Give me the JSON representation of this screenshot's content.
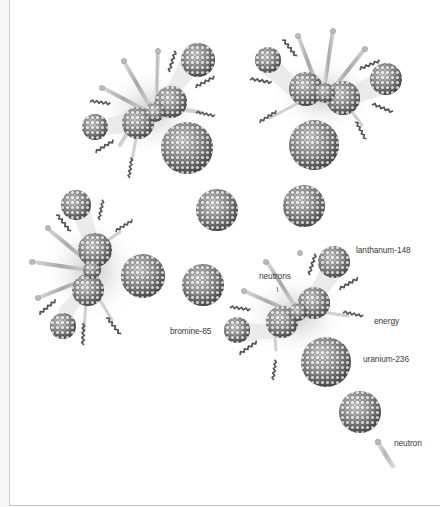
{
  "diagram": {
    "labels": {
      "lanthanum": "lanthanum-148",
      "neutrons": "neutrons",
      "energy": "energy",
      "uranium": "uranium-236",
      "bromine": "bromine-85",
      "neutron": "neutron"
    },
    "colors": {
      "background": "#ffffff",
      "nucleus_dark": "#3c3c3c",
      "nucleus_light": "#d9d9d9",
      "rod": "#b8b8b8",
      "energy_wave": "#555555",
      "label_text": "#3a3a3a",
      "frame": "#c8c8c8"
    },
    "events": [
      {
        "id": "fission-top-left",
        "splitting_nucleus_center": [
          152,
          110
        ]
      },
      {
        "id": "fission-top-right",
        "splitting_nucleus_center": [
          325,
          92
        ]
      },
      {
        "id": "fission-middle-left",
        "splitting_nucleus_center": [
          93,
          268
        ]
      },
      {
        "id": "fission-bottom-right",
        "splitting_nucleus_center": [
          296,
          312
        ]
      }
    ],
    "free_nuclei": [
      {
        "id": "uranium-a",
        "center": [
          187,
          145
        ],
        "r": 25
      },
      {
        "id": "uranium-b",
        "center": [
          314,
          148
        ],
        "r": 25
      },
      {
        "id": "uranium-c",
        "center": [
          217,
          207
        ],
        "r": 21
      },
      {
        "id": "uranium-d",
        "center": [
          303,
          205
        ],
        "r": 21
      },
      {
        "id": "uranium-e",
        "center": [
          143,
          276
        ],
        "r": 22
      },
      {
        "id": "uranium-f",
        "center": [
          203,
          285
        ],
        "r": 21
      },
      {
        "id": "uranium-g",
        "center": [
          327,
          361
        ],
        "r": 25
      },
      {
        "id": "uranium-h",
        "center": [
          358,
          410
        ],
        "r": 21
      }
    ]
  }
}
